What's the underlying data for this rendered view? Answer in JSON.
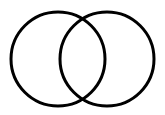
{
  "diagram": {
    "type": "venn",
    "background": "#ffffff",
    "stroke_color": "#000000",
    "stroke_width": 3,
    "circles": [
      {
        "id": "left",
        "cx": 58,
        "cy": 59,
        "r": 47
      },
      {
        "id": "right",
        "cx": 107,
        "cy": 59,
        "r": 47
      }
    ],
    "labels": []
  }
}
